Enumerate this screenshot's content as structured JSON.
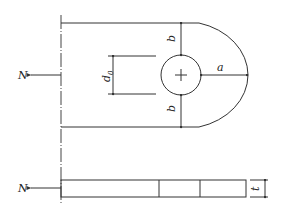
{
  "diagram": {
    "type": "engineering drawing - pin-connected plate (eye bar) with hole",
    "colors": {
      "line": "#333333",
      "background": "#ffffff"
    },
    "labels": {
      "force_top": "N",
      "force_bottom": "N",
      "hole_diameter": "d",
      "hole_diameter_sub": "0",
      "edge_top": "b",
      "edge_bottom": "b",
      "end_distance": "a",
      "thickness": "t"
    },
    "views": [
      "plan view",
      "side elevation"
    ]
  }
}
